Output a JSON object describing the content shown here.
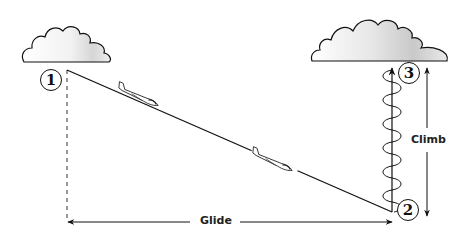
{
  "diagram": {
    "markers": [
      {
        "id": "1",
        "label": "1"
      },
      {
        "id": "2",
        "label": "2"
      },
      {
        "id": "3",
        "label": "3"
      }
    ],
    "labels": {
      "glide": "Glide",
      "climb": "Climb"
    },
    "elements": {
      "clouds": [
        "left-cloud",
        "right-cloud"
      ],
      "gliders": 2,
      "thermal_spiral": "climbing-spiral"
    },
    "colors": {
      "ink": "#111111",
      "cloud_shade": "#cfcfcf",
      "background": "#ffffff"
    }
  }
}
